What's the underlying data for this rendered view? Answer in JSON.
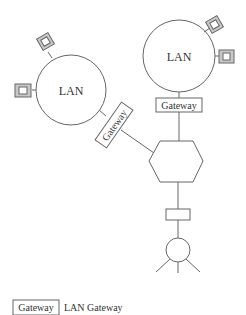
{
  "diagram": {
    "lan_left": {
      "label": "LAN"
    },
    "lan_right": {
      "label": "LAN"
    },
    "gateway_left": {
      "label": "Gateway"
    },
    "gateway_right": {
      "label": "Gateway"
    },
    "legend": {
      "symbol_label": "Gateway",
      "description": "LAN Gateway"
    },
    "colors": {
      "stroke": "#666666",
      "device_fill": "#c8c8c8",
      "background": "#ffffff"
    }
  }
}
